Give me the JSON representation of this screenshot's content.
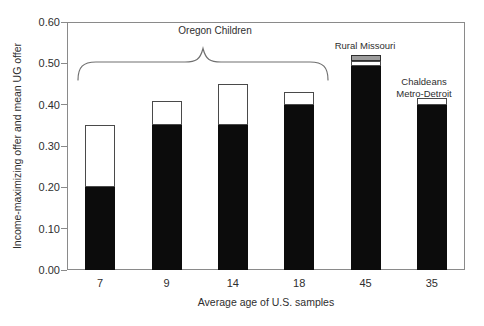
{
  "figure": {
    "background": "#ffffff",
    "y_axis": {
      "label": "Income-maximizing offer and mean UG offer",
      "ticks": [
        "0.00",
        "0.10",
        "0.20",
        "0.30",
        "0.40",
        "0.50",
        "0.60"
      ],
      "min": 0.0,
      "max": 0.6
    },
    "x_axis": {
      "label": "Average age of U.S. samples",
      "categories": [
        "7",
        "9",
        "14",
        "18",
        "45",
        "35"
      ]
    },
    "annotations": {
      "brace_label": "Oregon Children",
      "rural_missouri": "Rural Missouri",
      "chaldeans_line1": "Chaldeans",
      "chaldeans_line2": "Metro-Detroit"
    },
    "colors": {
      "bar_fill": "#0c0c0c",
      "bar_outline": "#4a4a4a",
      "cap_fill": "#9c9c9c",
      "cap_outline": "#2e2e2e",
      "frame": "#8a8a8a",
      "text": "#2e2e2e",
      "brace": "#707070"
    }
  },
  "chart_data": {
    "type": "bar",
    "stacked": true,
    "title": "",
    "xlabel": "Average age of U.S. samples",
    "ylabel": "Income-maximizing offer and mean UG offer",
    "ylim": [
      0,
      0.6
    ],
    "ytick_step": 0.1,
    "grid": false,
    "legend": false,
    "categories": [
      "7",
      "9",
      "14",
      "18",
      "45",
      "35"
    ],
    "series": [
      {
        "name": "Income-maximizing offer (black segment)",
        "values": [
          0.2,
          0.35,
          0.35,
          0.4,
          0.5,
          0.4
        ]
      },
      {
        "name": "Mean UG offer (total bar height)",
        "values": [
          0.35,
          0.41,
          0.45,
          0.43,
          0.52,
          0.415
        ]
      }
    ],
    "bars": [
      {
        "category": "7",
        "group": "Oregon Children",
        "segments": [
          {
            "kind": "black",
            "from": 0,
            "to": 0.2
          },
          {
            "kind": "white",
            "from": 0.2,
            "to": 0.35
          }
        ]
      },
      {
        "category": "9",
        "group": "Oregon Children",
        "segments": [
          {
            "kind": "black",
            "from": 0,
            "to": 0.35
          },
          {
            "kind": "white",
            "from": 0.35,
            "to": 0.41
          }
        ]
      },
      {
        "category": "14",
        "group": "Oregon Children",
        "segments": [
          {
            "kind": "black",
            "from": 0,
            "to": 0.35
          },
          {
            "kind": "white",
            "from": 0.35,
            "to": 0.45
          }
        ]
      },
      {
        "category": "18",
        "group": "Oregon Children",
        "segments": [
          {
            "kind": "black",
            "from": 0,
            "to": 0.4
          },
          {
            "kind": "white",
            "from": 0.4,
            "to": 0.43
          }
        ]
      },
      {
        "category": "45",
        "group": "Rural Missouri",
        "segments": [
          {
            "kind": "black",
            "from": 0,
            "to": 0.493
          },
          {
            "kind": "white",
            "from": 0.493,
            "to": 0.505
          },
          {
            "kind": "cap",
            "from": 0.505,
            "to": 0.52
          }
        ]
      },
      {
        "category": "35",
        "group": "Chaldeans Metro-Detroit",
        "segments": [
          {
            "kind": "black",
            "from": 0,
            "to": 0.4
          },
          {
            "kind": "white",
            "from": 0.4,
            "to": 0.415
          }
        ]
      }
    ],
    "annotations": [
      {
        "text": "Oregon Children",
        "style": "curly-brace",
        "targets": [
          "7",
          "9",
          "14",
          "18"
        ]
      },
      {
        "text": "Rural Missouri",
        "style": "label",
        "targets": [
          "45"
        ]
      },
      {
        "text": "Chaldeans Metro-Detroit",
        "style": "label",
        "targets": [
          "35"
        ]
      }
    ]
  }
}
